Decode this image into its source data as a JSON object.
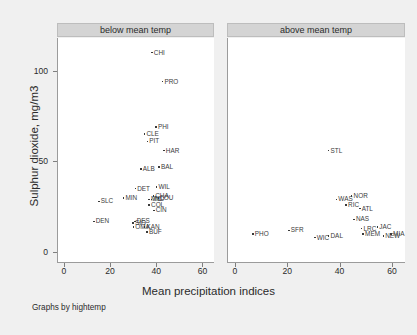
{
  "chart_data": {
    "type": "scatter",
    "title": "",
    "xlabel": "Mean precipitation indices",
    "ylabel": "Sulphur dioxide, mg/m3",
    "caption": "Graphs by hightemp",
    "xlim": [
      -3,
      65
    ],
    "ylim": [
      -6,
      118
    ],
    "xticks": [
      0,
      20,
      40,
      60
    ],
    "yticks": [
      0,
      50,
      100
    ],
    "grid": false,
    "legend": "none",
    "point_label_field": "city",
    "panels": [
      {
        "label": "below mean temp",
        "points": [
          {
            "city": "CHI",
            "x": 38.2,
            "y": 110
          },
          {
            "city": "PRO",
            "x": 42.8,
            "y": 94
          },
          {
            "city": "PHI",
            "x": 40.0,
            "y": 69
          },
          {
            "city": "CLE",
            "x": 35.0,
            "y": 65
          },
          {
            "city": "PIT",
            "x": 36.2,
            "y": 61
          },
          {
            "city": "HAR",
            "x": 43.4,
            "y": 56
          },
          {
            "city": "ALB",
            "x": 33.4,
            "y": 46
          },
          {
            "city": "BAL",
            "x": 41.3,
            "y": 47
          },
          {
            "city": "DET",
            "x": 31.0,
            "y": 35
          },
          {
            "city": "WIL",
            "x": 40.2,
            "y": 36
          },
          {
            "city": "CHA",
            "x": 38.8,
            "y": 31
          },
          {
            "city": "LOU",
            "x": 41.0,
            "y": 30
          },
          {
            "city": "IND",
            "x": 38.0,
            "y": 29
          },
          {
            "city": "MIL",
            "x": 37.0,
            "y": 29
          },
          {
            "city": "MIN",
            "x": 25.9,
            "y": 30
          },
          {
            "city": "SLC",
            "x": 15.2,
            "y": 28
          },
          {
            "city": "COL",
            "x": 37.0,
            "y": 26
          },
          {
            "city": "CIN",
            "x": 39.0,
            "y": 23
          },
          {
            "city": "DEN",
            "x": 13.0,
            "y": 17
          },
          {
            "city": "DES",
            "x": 30.8,
            "y": 17
          },
          {
            "city": "SIO",
            "x": 30.0,
            "y": 16
          },
          {
            "city": "OMA",
            "x": 30.2,
            "y": 14
          },
          {
            "city": "KAN",
            "x": 35.0,
            "y": 14
          },
          {
            "city": "BUF",
            "x": 36.1,
            "y": 11
          }
        ]
      },
      {
        "label": "above mean temp",
        "points": [
          {
            "city": "STL",
            "x": 35.9,
            "y": 56
          },
          {
            "city": "WAS",
            "x": 38.9,
            "y": 29
          },
          {
            "city": "NOR",
            "x": 44.7,
            "y": 31
          },
          {
            "city": "RIC",
            "x": 42.6,
            "y": 26
          },
          {
            "city": "ATL",
            "x": 47.8,
            "y": 24
          },
          {
            "city": "NAS",
            "x": 45.6,
            "y": 18
          },
          {
            "city": "LRC",
            "x": 48.5,
            "y": 13
          },
          {
            "city": "JAC",
            "x": 54.5,
            "y": 14
          },
          {
            "city": "PHO",
            "x": 7.0,
            "y": 10
          },
          {
            "city": "SFR",
            "x": 20.7,
            "y": 12
          },
          {
            "city": "WIC",
            "x": 30.6,
            "y": 8
          },
          {
            "city": "DAL",
            "x": 35.9,
            "y": 9
          },
          {
            "city": "MEM",
            "x": 49.1,
            "y": 10
          },
          {
            "city": "MIA",
            "x": 59.8,
            "y": 10
          },
          {
            "city": "NEW",
            "x": 56.8,
            "y": 9
          }
        ]
      }
    ]
  }
}
